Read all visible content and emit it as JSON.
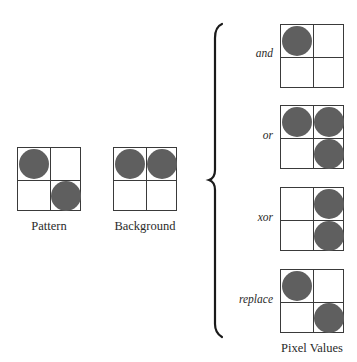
{
  "diagram": {
    "inputs": [
      {
        "id": "pattern",
        "caption": "Pattern",
        "cells": [
          1,
          0,
          0,
          1
        ]
      },
      {
        "id": "background",
        "caption": "Background",
        "cells": [
          1,
          1,
          0,
          0
        ]
      }
    ],
    "operations": [
      {
        "id": "and",
        "label": "and",
        "cells": [
          1,
          0,
          0,
          0
        ]
      },
      {
        "id": "or",
        "label": "or",
        "cells": [
          1,
          1,
          0,
          1
        ]
      },
      {
        "id": "xor",
        "label": "xor",
        "cells": [
          0,
          1,
          0,
          1
        ]
      },
      {
        "id": "replace",
        "label": "replace",
        "cells": [
          1,
          0,
          0,
          1
        ]
      }
    ],
    "result_caption": "Pixel Values",
    "colors": {
      "pixel_on": "#5f5f5f",
      "grid_line": "#3a3a3a",
      "background": "#ffffff"
    }
  }
}
